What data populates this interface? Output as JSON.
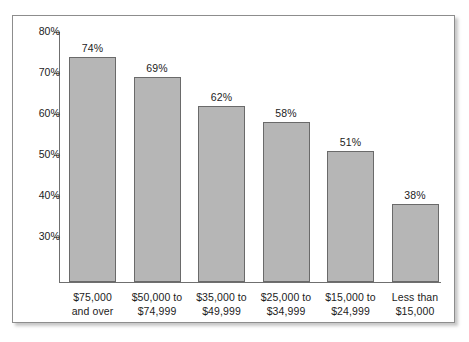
{
  "chart_data": {
    "type": "bar",
    "title": "",
    "subtitle": "",
    "xlabel": "",
    "ylabel": "",
    "categories": [
      "$75,000 and over",
      "$50,000 to $74,999",
      "$35,000 to $49,999",
      "$25,000 to $34,999",
      "$15,000 to $24,999",
      "Less than $15,000"
    ],
    "category_lines": [
      [
        "$75,000",
        "and over"
      ],
      [
        "$50,000 to",
        "$74,999"
      ],
      [
        "$35,000 to",
        "$49,999"
      ],
      [
        "$25,000 to",
        "$34,999"
      ],
      [
        "$15,000 to",
        "$24,999"
      ],
      [
        "Less than",
        "$15,000"
      ]
    ],
    "values": [
      74,
      69,
      62,
      58,
      51,
      38
    ],
    "value_labels": [
      "74%",
      "69%",
      "62%",
      "58%",
      "51%",
      "38%"
    ],
    "ytick_labels": [
      "80%",
      "70%",
      "60%",
      "50%",
      "40%",
      "30%"
    ],
    "yticks": [
      80,
      70,
      60,
      50,
      40,
      30
    ],
    "ylim": [
      19,
      82
    ],
    "grid": false,
    "legend": null,
    "colors": {
      "bar_fill": "#b6b6b6",
      "bar_stroke": "#6a6a6a",
      "axis": "#6f6f6f",
      "text": "#1c1c1c",
      "frame": "#8d8d8d",
      "background": "#ffffff"
    }
  }
}
